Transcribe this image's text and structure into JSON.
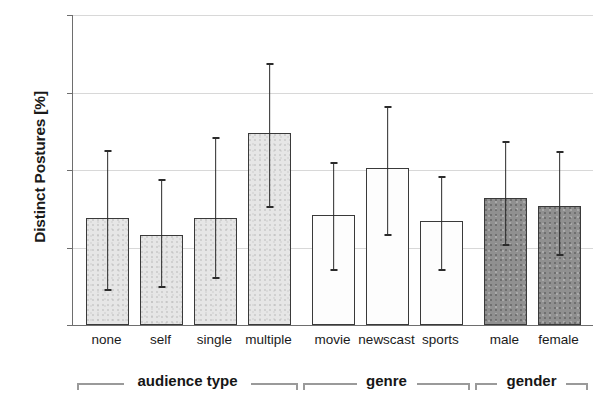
{
  "chart_data": {
    "type": "bar",
    "title": "",
    "subtitle": "",
    "xlabel": "",
    "ylabel": "Distinct Postures [%]",
    "ylim": [
      0,
      20
    ],
    "yticks": [
      0,
      5,
      10,
      15,
      20
    ],
    "ytick_labels": [
      "0",
      "5",
      "10",
      "15",
      "20"
    ],
    "grid": true,
    "legend": "none",
    "orientation": "vertical",
    "error_bars": "asymmetric whiskers with caps",
    "categories": [
      "none",
      "self",
      "single",
      "multiple",
      "movie",
      "newscast",
      "sports",
      "male",
      "female"
    ],
    "values": [
      6.9,
      5.8,
      6.9,
      12.4,
      7.1,
      10.1,
      6.7,
      8.2,
      7.7
    ],
    "err_low": [
      2.3,
      2.5,
      3.1,
      7.7,
      3.6,
      5.9,
      3.6,
      5.2,
      4.6
    ],
    "err_high": [
      11.3,
      9.4,
      12.1,
      16.9,
      10.5,
      14.1,
      9.6,
      11.9,
      11.2
    ],
    "bar_styles": [
      "light",
      "light",
      "light",
      "light",
      "white",
      "white",
      "white",
      "dark",
      "dark"
    ],
    "groups": [
      {
        "label": "audience type",
        "start": 0,
        "end": 3
      },
      {
        "label": "genre",
        "start": 4,
        "end": 6
      },
      {
        "label": "gender",
        "start": 7,
        "end": 8
      }
    ],
    "colors": {
      "fill_light": "#e6e6e6",
      "fill_white": "#fdfdfd",
      "fill_dark": "#909090",
      "bar_outline": "#3a3a3a",
      "error_bar": "#2b2b2b",
      "grid": "#d8d8d8",
      "axis": "#6e6e6e",
      "text": "#1a1a1a",
      "bracket": "#9a9a9a"
    }
  }
}
